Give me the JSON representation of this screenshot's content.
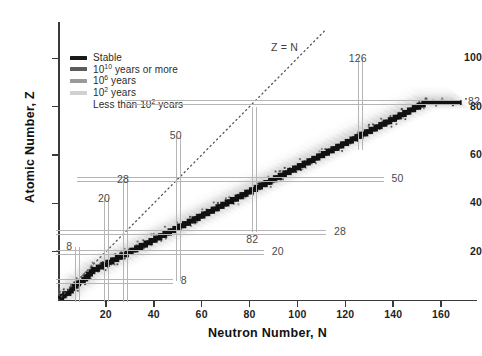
{
  "chart_data": {
    "type": "scatter",
    "title": "",
    "xlabel": "Neutron Number, N",
    "ylabel": "Atomic Number, Z",
    "xlim": [
      0,
      175
    ],
    "ylim": [
      0,
      115
    ],
    "xticks": [
      20,
      40,
      60,
      80,
      100,
      120,
      140,
      160
    ],
    "yticks": [
      20,
      40,
      60,
      80,
      100
    ],
    "grid": false,
    "legend_position": "upper-left",
    "legend": [
      {
        "label": "Stable",
        "color": "#1a1a1a",
        "swatch": true
      },
      {
        "label": "10¹⁰ years or more",
        "color": "#5c5c5c",
        "swatch": true
      },
      {
        "label": "10⁶ years",
        "color": "#9a9a9a",
        "swatch": true
      },
      {
        "label": "10² years",
        "color": "#d0d0d0",
        "swatch": true
      },
      {
        "label": "Less than 10² years",
        "color": "#e8e8e8",
        "swatch": false
      }
    ],
    "legend_rows": [
      {
        "base": "Stable",
        "sup": "",
        "tail": ""
      },
      {
        "base": "10",
        "sup": "10",
        "tail": " years or more"
      },
      {
        "base": "10",
        "sup": "6",
        "tail": " years"
      },
      {
        "base": "10",
        "sup": "2",
        "tail": " years"
      },
      {
        "base": "Less than 10",
        "sup": "2",
        "tail": " years"
      }
    ],
    "reference_line": {
      "label": "Z = N",
      "style": "dotted",
      "slope": 1,
      "intercept": 0
    },
    "magic_numbers_neutron": [
      8,
      20,
      28,
      50,
      82,
      126
    ],
    "magic_numbers_proton": [
      8,
      20,
      28,
      50,
      82
    ],
    "annotations": [
      {
        "text": "8",
        "axis": "N",
        "value": 8
      },
      {
        "text": "20",
        "axis": "N",
        "value": 20
      },
      {
        "text": "28",
        "axis": "N",
        "value": 28
      },
      {
        "text": "50",
        "axis": "N",
        "value": 50
      },
      {
        "text": "82",
        "axis": "N",
        "value": 82
      },
      {
        "text": "126",
        "axis": "N",
        "value": 126
      },
      {
        "text": "8",
        "axis": "Z",
        "value": 8
      },
      {
        "text": "20",
        "axis": "Z",
        "value": 20
      },
      {
        "text": "28",
        "axis": "Z",
        "value": 28
      },
      {
        "text": "50",
        "axis": "Z",
        "value": 50
      },
      {
        "text": "82",
        "axis": "Z",
        "value": 82
      }
    ],
    "stable_band": [
      [
        0,
        1
      ],
      [
        1,
        1
      ],
      [
        1,
        2
      ],
      [
        2,
        2
      ],
      [
        2,
        3
      ],
      [
        3,
        3
      ],
      [
        4,
        3
      ],
      [
        4,
        4
      ],
      [
        5,
        4
      ],
      [
        5,
        5
      ],
      [
        6,
        5
      ],
      [
        6,
        6
      ],
      [
        7,
        6
      ],
      [
        7,
        7
      ],
      [
        8,
        7
      ],
      [
        8,
        8
      ],
      [
        9,
        8
      ],
      [
        10,
        8
      ],
      [
        10,
        9
      ],
      [
        11,
        9
      ],
      [
        11,
        10
      ],
      [
        12,
        10
      ],
      [
        12,
        11
      ],
      [
        13,
        11
      ],
      [
        13,
        12
      ],
      [
        14,
        12
      ],
      [
        14,
        13
      ],
      [
        15,
        13
      ],
      [
        16,
        13
      ],
      [
        16,
        14
      ],
      [
        17,
        14
      ],
      [
        18,
        14
      ],
      [
        18,
        15
      ],
      [
        19,
        15
      ],
      [
        20,
        15
      ],
      [
        20,
        16
      ],
      [
        21,
        16
      ],
      [
        22,
        16
      ],
      [
        22,
        17
      ],
      [
        23,
        17
      ],
      [
        24,
        17
      ],
      [
        24,
        18
      ],
      [
        25,
        18
      ],
      [
        26,
        18
      ],
      [
        26,
        19
      ],
      [
        27,
        19
      ],
      [
        28,
        19
      ],
      [
        28,
        20
      ],
      [
        29,
        20
      ],
      [
        30,
        20
      ],
      [
        30,
        21
      ],
      [
        31,
        21
      ],
      [
        32,
        21
      ],
      [
        32,
        22
      ],
      [
        33,
        22
      ],
      [
        34,
        22
      ],
      [
        34,
        23
      ],
      [
        35,
        23
      ],
      [
        36,
        23
      ],
      [
        36,
        24
      ],
      [
        37,
        24
      ],
      [
        38,
        24
      ],
      [
        38,
        25
      ],
      [
        39,
        25
      ],
      [
        40,
        25
      ],
      [
        40,
        26
      ],
      [
        41,
        26
      ],
      [
        42,
        26
      ],
      [
        42,
        27
      ],
      [
        43,
        27
      ],
      [
        44,
        27
      ],
      [
        44,
        28
      ],
      [
        45,
        28
      ],
      [
        46,
        28
      ],
      [
        46,
        29
      ],
      [
        47,
        29
      ],
      [
        48,
        29
      ],
      [
        48,
        30
      ],
      [
        49,
        30
      ],
      [
        50,
        30
      ],
      [
        50,
        31
      ],
      [
        51,
        31
      ],
      [
        52,
        31
      ],
      [
        52,
        32
      ],
      [
        53,
        32
      ],
      [
        54,
        32
      ],
      [
        54,
        33
      ],
      [
        55,
        33
      ],
      [
        56,
        33
      ],
      [
        56,
        34
      ],
      [
        57,
        34
      ],
      [
        58,
        34
      ],
      [
        58,
        35
      ],
      [
        59,
        35
      ],
      [
        60,
        35
      ],
      [
        60,
        36
      ],
      [
        61,
        36
      ],
      [
        62,
        36
      ],
      [
        62,
        37
      ],
      [
        63,
        37
      ],
      [
        64,
        37
      ],
      [
        64,
        38
      ],
      [
        65,
        38
      ],
      [
        66,
        38
      ],
      [
        66,
        39
      ],
      [
        67,
        39
      ],
      [
        68,
        39
      ],
      [
        68,
        40
      ],
      [
        69,
        40
      ],
      [
        70,
        40
      ],
      [
        70,
        41
      ],
      [
        71,
        41
      ],
      [
        72,
        41
      ],
      [
        72,
        42
      ],
      [
        73,
        42
      ],
      [
        74,
        42
      ],
      [
        74,
        43
      ],
      [
        75,
        43
      ],
      [
        76,
        43
      ],
      [
        76,
        44
      ],
      [
        77,
        44
      ],
      [
        78,
        44
      ],
      [
        78,
        45
      ],
      [
        79,
        45
      ],
      [
        80,
        45
      ],
      [
        80,
        46
      ],
      [
        81,
        46
      ],
      [
        82,
        46
      ],
      [
        82,
        47
      ],
      [
        83,
        47
      ],
      [
        84,
        47
      ],
      [
        84,
        48
      ],
      [
        85,
        48
      ],
      [
        86,
        48
      ],
      [
        86,
        49
      ],
      [
        87,
        49
      ],
      [
        88,
        49
      ],
      [
        88,
        50
      ],
      [
        89,
        50
      ],
      [
        90,
        50
      ],
      [
        90,
        51
      ],
      [
        91,
        51
      ],
      [
        92,
        51
      ],
      [
        92,
        52
      ],
      [
        93,
        52
      ],
      [
        94,
        52
      ],
      [
        94,
        53
      ],
      [
        95,
        53
      ],
      [
        96,
        53
      ],
      [
        96,
        54
      ],
      [
        97,
        54
      ],
      [
        98,
        54
      ],
      [
        98,
        55
      ],
      [
        99,
        55
      ],
      [
        100,
        55
      ],
      [
        100,
        56
      ],
      [
        101,
        56
      ],
      [
        102,
        56
      ],
      [
        102,
        57
      ],
      [
        103,
        57
      ],
      [
        104,
        57
      ],
      [
        104,
        58
      ],
      [
        105,
        58
      ],
      [
        106,
        58
      ],
      [
        106,
        59
      ],
      [
        107,
        59
      ],
      [
        108,
        59
      ],
      [
        108,
        60
      ],
      [
        109,
        60
      ],
      [
        110,
        60
      ],
      [
        110,
        61
      ],
      [
        111,
        61
      ],
      [
        112,
        61
      ],
      [
        112,
        62
      ],
      [
        113,
        62
      ],
      [
        114,
        62
      ],
      [
        114,
        63
      ],
      [
        115,
        63
      ],
      [
        116,
        63
      ],
      [
        116,
        64
      ],
      [
        117,
        64
      ],
      [
        118,
        64
      ],
      [
        118,
        65
      ],
      [
        119,
        65
      ],
      [
        120,
        65
      ],
      [
        120,
        66
      ],
      [
        121,
        66
      ],
      [
        122,
        66
      ],
      [
        122,
        67
      ],
      [
        123,
        67
      ],
      [
        124,
        67
      ],
      [
        124,
        68
      ],
      [
        125,
        68
      ],
      [
        126,
        68
      ],
      [
        126,
        69
      ],
      [
        127,
        69
      ],
      [
        128,
        69
      ],
      [
        128,
        70
      ],
      [
        129,
        70
      ],
      [
        130,
        70
      ],
      [
        130,
        71
      ],
      [
        131,
        71
      ],
      [
        132,
        71
      ],
      [
        132,
        72
      ],
      [
        133,
        72
      ],
      [
        134,
        72
      ],
      [
        134,
        73
      ],
      [
        135,
        73
      ],
      [
        136,
        73
      ],
      [
        136,
        74
      ],
      [
        137,
        74
      ],
      [
        138,
        74
      ],
      [
        138,
        75
      ],
      [
        139,
        75
      ],
      [
        140,
        75
      ],
      [
        140,
        76
      ],
      [
        141,
        76
      ],
      [
        142,
        76
      ],
      [
        142,
        77
      ],
      [
        143,
        77
      ],
      [
        144,
        77
      ],
      [
        144,
        78
      ],
      [
        145,
        78
      ],
      [
        146,
        78
      ],
      [
        146,
        79
      ],
      [
        147,
        79
      ],
      [
        148,
        79
      ],
      [
        148,
        80
      ],
      [
        149,
        80
      ],
      [
        150,
        80
      ],
      [
        150,
        81
      ],
      [
        151,
        81
      ],
      [
        152,
        81
      ],
      [
        152,
        82
      ],
      [
        153,
        82
      ],
      [
        154,
        82
      ],
      [
        155,
        82
      ],
      [
        156,
        82
      ],
      [
        157,
        82
      ],
      [
        158,
        82
      ],
      [
        159,
        82
      ],
      [
        160,
        82
      ],
      [
        161,
        82
      ],
      [
        162,
        82
      ],
      [
        163,
        82
      ],
      [
        164,
        82
      ],
      [
        165,
        82
      ],
      [
        166,
        82
      ],
      [
        167,
        82
      ]
    ]
  }
}
